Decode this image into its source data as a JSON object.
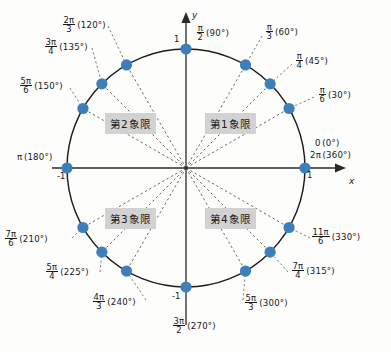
{
  "figure": {
    "type": "unit-circle",
    "axis_x_label": "x",
    "axis_y_label": "y",
    "dot_color": "#3d7fba",
    "circle_color": "#1d1d1d",
    "ray_color": "#5a5a5a",
    "highlight_color": "#d2d2d2",
    "center": [
      186,
      168
    ],
    "radius": 119
  },
  "ticks": {
    "top": "1",
    "bottom": "-1",
    "left": "-1",
    "right": "1"
  },
  "quadrants": [
    {
      "name": "quadrant-1",
      "label": "第1象限",
      "x": 205,
      "y": 113
    },
    {
      "name": "quadrant-2",
      "label": "第2象限",
      "x": 105,
      "y": 113
    },
    {
      "name": "quadrant-3",
      "label": "第3象限",
      "x": 105,
      "y": 208
    },
    {
      "name": "quadrant-4",
      "label": "第4象限",
      "x": 205,
      "y": 208
    }
  ],
  "points": [
    {
      "name": "angle-0",
      "degrees": "0",
      "deg_text": "(0°)",
      "radian_type": "plain",
      "radian": "0",
      "num": "",
      "den": "",
      "deg_num": 0
    },
    {
      "name": "angle-360",
      "degrees": "360",
      "deg_text": "(360°)",
      "radian_type": "plain",
      "radian": "2π",
      "num": "",
      "den": "",
      "deg_num": 360
    },
    {
      "name": "angle-30",
      "degrees": "30",
      "deg_text": "(30°)",
      "radian_type": "frac",
      "radian": "",
      "num": "π",
      "den": "6",
      "deg_num": 30
    },
    {
      "name": "angle-45",
      "degrees": "45",
      "deg_text": "(45°)",
      "radian_type": "frac",
      "radian": "",
      "num": "π",
      "den": "4",
      "deg_num": 45
    },
    {
      "name": "angle-60",
      "degrees": "60",
      "deg_text": "(60°)",
      "radian_type": "frac",
      "radian": "",
      "num": "π",
      "den": "3",
      "deg_num": 60
    },
    {
      "name": "angle-90",
      "degrees": "90",
      "deg_text": "(90°)",
      "radian_type": "frac",
      "radian": "",
      "num": "π",
      "den": "2",
      "deg_num": 90
    },
    {
      "name": "angle-120",
      "degrees": "120",
      "deg_text": "(120°)",
      "radian_type": "frac",
      "radian": "",
      "num": "2π",
      "den": "3",
      "deg_num": 120
    },
    {
      "name": "angle-135",
      "degrees": "135",
      "deg_text": "(135°)",
      "radian_type": "frac",
      "radian": "",
      "num": "3π",
      "den": "4",
      "deg_num": 135
    },
    {
      "name": "angle-150",
      "degrees": "150",
      "deg_text": "(150°)",
      "radian_type": "frac",
      "radian": "",
      "num": "5π",
      "den": "6",
      "deg_num": 150
    },
    {
      "name": "angle-180",
      "degrees": "180",
      "deg_text": "(180°)",
      "radian_type": "plain",
      "radian": "π",
      "num": "",
      "den": "",
      "deg_num": 180
    },
    {
      "name": "angle-210",
      "degrees": "210",
      "deg_text": "(210°)",
      "radian_type": "frac",
      "radian": "",
      "num": "7π",
      "den": "6",
      "deg_num": 210
    },
    {
      "name": "angle-225",
      "degrees": "225",
      "deg_text": "(225°)",
      "radian_type": "frac",
      "radian": "",
      "num": "5π",
      "den": "4",
      "deg_num": 225
    },
    {
      "name": "angle-240",
      "degrees": "240",
      "deg_text": "(240°)",
      "radian_type": "frac",
      "radian": "",
      "num": "4π",
      "den": "3",
      "deg_num": 240
    },
    {
      "name": "angle-270",
      "degrees": "270",
      "deg_text": "(270°)",
      "radian_type": "frac",
      "radian": "",
      "num": "3π",
      "den": "2",
      "deg_num": 270
    },
    {
      "name": "angle-300",
      "degrees": "300",
      "deg_text": "(300°)",
      "radian_type": "frac",
      "radian": "",
      "num": "5π",
      "den": "3",
      "deg_num": 300
    },
    {
      "name": "angle-315",
      "degrees": "315",
      "deg_text": "(315°)",
      "radian_type": "frac",
      "radian": "",
      "num": "7π",
      "den": "4",
      "deg_num": 315
    },
    {
      "name": "angle-330",
      "degrees": "330",
      "deg_text": "(330°)",
      "radian_type": "frac",
      "radian": "",
      "num": "11π",
      "den": "6",
      "deg_num": 330
    }
  ],
  "labels": {
    "l_120": {
      "x": 62,
      "y": 16,
      "num": "2π",
      "den": "3",
      "deg": "(120°)"
    },
    "l_135": {
      "x": 44,
      "y": 38,
      "num": "3π",
      "den": "4",
      "deg": "(135°)"
    },
    "l_150": {
      "x": 19,
      "y": 77,
      "num": "5π",
      "den": "6",
      "deg": "(150°)"
    },
    "l_90": {
      "x": 196,
      "y": 24,
      "num": "π",
      "den": "2",
      "deg": "(90°)"
    },
    "l_60": {
      "x": 265,
      "y": 23,
      "num": "π",
      "den": "3",
      "deg": "(60°)"
    },
    "l_45": {
      "x": 295,
      "y": 52,
      "num": "π",
      "den": "4",
      "deg": "(45°)"
    },
    "l_30": {
      "x": 318,
      "y": 86,
      "num": "π",
      "den": "6",
      "deg": "(30°)"
    },
    "l_210": {
      "x": 4,
      "y": 230,
      "num": "7π",
      "den": "6",
      "deg": "(210°)"
    },
    "l_225": {
      "x": 45,
      "y": 263,
      "num": "5π",
      "den": "4",
      "deg": "(225°)"
    },
    "l_240": {
      "x": 92,
      "y": 293,
      "num": "4π",
      "den": "3",
      "deg": "(240°)"
    },
    "l_270": {
      "x": 172,
      "y": 317,
      "num": "3π",
      "den": "2",
      "deg": "(270°)"
    },
    "l_300": {
      "x": 244,
      "y": 294,
      "num": "5π",
      "den": "3",
      "deg": "(300°)"
    },
    "l_315": {
      "x": 291,
      "y": 262,
      "num": "7π",
      "den": "4",
      "deg": "(315°)"
    },
    "l_330": {
      "x": 311,
      "y": 228,
      "num": "11π",
      "den": "6",
      "deg": "(330°)"
    },
    "l_180": {
      "x": 17,
      "y": 153,
      "text": "π",
      "deg": "(180°)"
    },
    "l_0": {
      "x": 315,
      "y": 139,
      "text": "0",
      "deg": "(0°)"
    },
    "l_360": {
      "x": 310,
      "y": 151,
      "text": "2π",
      "deg": "(360°)"
    }
  }
}
